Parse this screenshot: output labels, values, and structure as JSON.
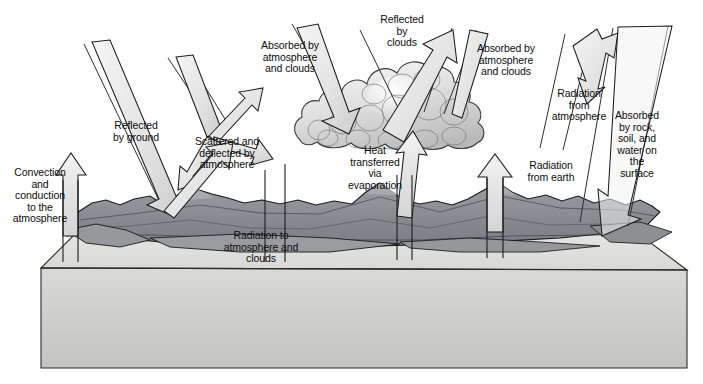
{
  "diagram": {
    "type": "earth-energy-balance",
    "background_color": "#ffffff",
    "palette": {
      "arrow_fill_light": "#e8e8e8",
      "arrow_fill_mid": "#d5d5d5",
      "arrow_stroke": "#1a1a1a",
      "terrain_fill": "#8f9094",
      "terrain_dark": "#6e6f74",
      "ground_top": "#e2e2e0",
      "ground_front": "#cfcfcf",
      "cloud_fill": "#d9d9d9",
      "cloud_light": "#f1f1f1",
      "text_color": "#0d0d0d"
    },
    "labels": [
      {
        "id": "convection-conduction",
        "text": "Convection\nand\nconduction\nto the\natmosphere",
        "x": 2,
        "y": 167,
        "width": 76,
        "flow": "upward",
        "align": "center"
      },
      {
        "id": "reflected-by-ground",
        "text": "Reflected\nby ground",
        "x": 101,
        "y": 120,
        "width": 70,
        "flow": "upward",
        "align": "center"
      },
      {
        "id": "scattered-deflected",
        "text": "Scattered and\ndeflected by\natmosphere",
        "x": 183,
        "y": 136,
        "width": 88,
        "flow": "scatter",
        "align": "center"
      },
      {
        "id": "absorbed-by-atmosphere-left",
        "text": "Absorbed by\natmosphere\nand clouds",
        "x": 249,
        "y": 40,
        "width": 82,
        "flow": "downward",
        "align": "center"
      },
      {
        "id": "reflected-by-clouds",
        "text": "Reflected\nby\nclouds",
        "x": 371,
        "y": 14,
        "width": 62,
        "flow": "upward",
        "align": "center"
      },
      {
        "id": "absorbed-by-atmosphere-right",
        "text": "Absorbed by\natmosphere\nand clouds",
        "x": 465,
        "y": 43,
        "width": 82,
        "flow": "downward",
        "align": "center"
      },
      {
        "id": "radiation-from-atmosphere",
        "text": "Radiation\nfrom\natmosphere",
        "x": 541,
        "y": 88,
        "width": 76,
        "flow": "downward",
        "align": "center"
      },
      {
        "id": "absorbed-by-rock",
        "text": "Absorbed\nby rock,\nsoil, and\nwater on\nthe\nsurface",
        "x": 606,
        "y": 110,
        "width": 62,
        "flow": "downward",
        "align": "center"
      },
      {
        "id": "heat-transferred-evaporation",
        "text": "Heat\ntransferred\nvia\nevaporation",
        "x": 337,
        "y": 145,
        "width": 76,
        "flow": "upward",
        "align": "center"
      },
      {
        "id": "radiation-from-earth",
        "text": "Radiation\nfrom earth",
        "x": 514,
        "y": 160,
        "width": 74,
        "flow": "upward",
        "align": "center"
      },
      {
        "id": "radiation-to-atmosphere-clouds",
        "text": "Radiation to\natmosphere and\nclouds",
        "x": 206,
        "y": 230,
        "width": 110,
        "flow": "upward",
        "align": "center"
      }
    ],
    "flows": [
      {
        "id": "incoming-solar-left",
        "label": "incoming solar beam (left)",
        "direction": "down-right"
      },
      {
        "id": "incoming-solar-scatter",
        "label": "incoming solar beam (scattering)",
        "direction": "down-right"
      },
      {
        "id": "incoming-solar-cloud",
        "label": "incoming solar beam to clouds",
        "direction": "down-right"
      },
      {
        "id": "incoming-solar-right",
        "label": "incoming solar beam (right)",
        "direction": "down-left"
      },
      {
        "id": "incoming-solar-surface",
        "label": "incoming solar beam to surface",
        "direction": "down-left"
      }
    ],
    "scene": {
      "ground_block": "3D slab of earth in perspective",
      "terrain": "mountain ridge across the surface",
      "cloud": "cumulus cloud mass at center"
    }
  }
}
